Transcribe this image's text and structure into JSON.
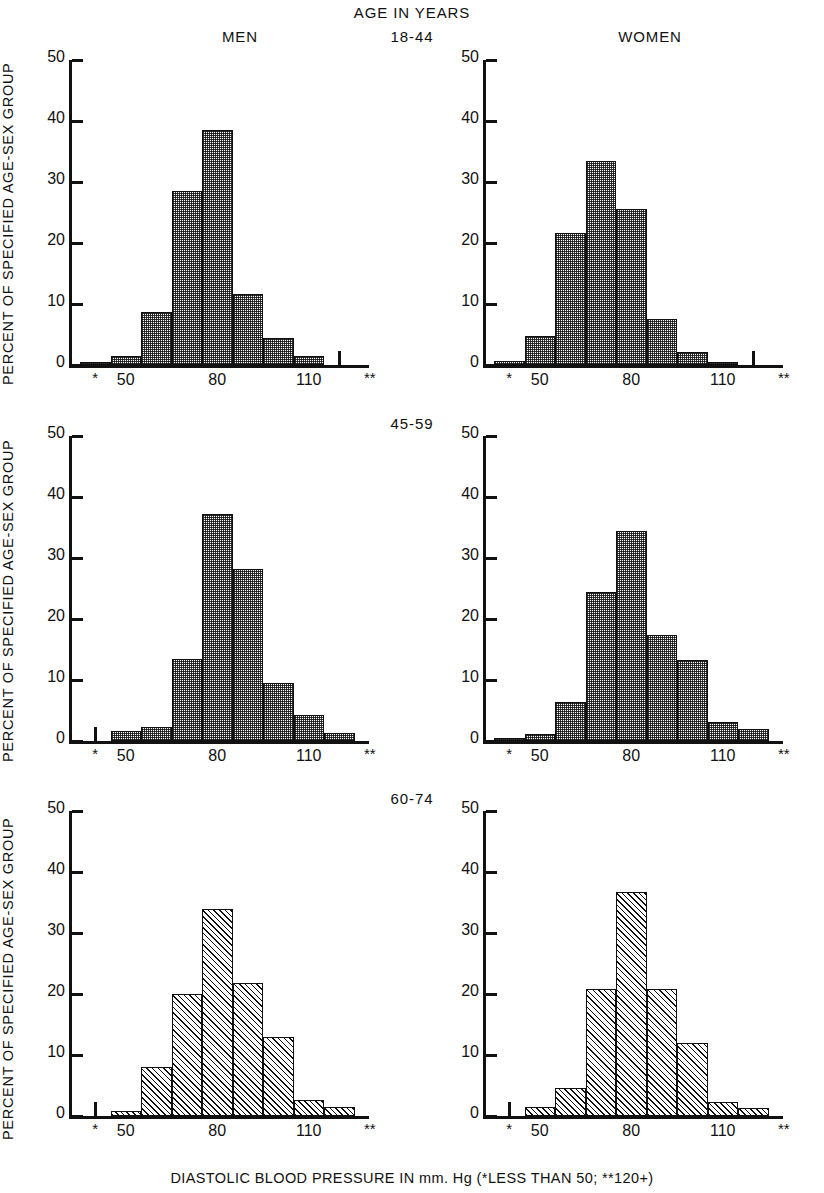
{
  "figure": {
    "super_title": "AGE IN YEARS",
    "column_titles": {
      "left": "MEN",
      "right": "WOMEN"
    },
    "y_axis_title": "PERCENT OF SPECIFIED AGE-SEX GROUP",
    "x_axis_caption": "DIASTOLIC BLOOD PRESSURE IN mm. Hg (*LESS THAN 50; **120+)",
    "row_labels": [
      "18-44",
      "45-59",
      "60-74"
    ],
    "y_ticks": [
      "0",
      "10",
      "20",
      "30",
      "40",
      "50"
    ],
    "x_ticks": [
      "*",
      "50",
      "80",
      "110",
      "**"
    ]
  },
  "chart_data": [
    {
      "type": "bar",
      "title": "MEN 18-44",
      "panel_id": "men-18-44",
      "sex": "MEN",
      "age_group": "18-44",
      "xlabel": "DIASTOLIC BLOOD PRESSURE IN mm. Hg",
      "ylabel": "PERCENT OF SPECIFIED AGE-SEX GROUP",
      "ylim": [
        0,
        50
      ],
      "yticks": [
        0,
        10,
        20,
        30,
        40,
        50
      ],
      "grid": false,
      "legend": "none",
      "categories": [
        "<50",
        "50-59",
        "60-69",
        "70-79",
        "80-89",
        "90-99",
        "100-109",
        "110-119",
        "120+"
      ],
      "values": [
        0.5,
        1.5,
        8.7,
        28.5,
        38.5,
        11.7,
        4.5,
        1.5,
        0.3
      ]
    },
    {
      "type": "bar",
      "title": "WOMEN 18-44",
      "panel_id": "women-18-44",
      "sex": "WOMEN",
      "age_group": "18-44",
      "xlabel": "DIASTOLIC BLOOD PRESSURE IN mm. Hg",
      "ylabel": "PERCENT OF SPECIFIED AGE-SEX GROUP",
      "ylim": [
        0,
        50
      ],
      "yticks": [
        0,
        10,
        20,
        30,
        40,
        50
      ],
      "grid": false,
      "legend": "none",
      "categories": [
        "<50",
        "50-59",
        "60-69",
        "70-79",
        "80-89",
        "90-99",
        "100-109",
        "110-119",
        "120+"
      ],
      "values": [
        0.6,
        4.7,
        21.7,
        33.4,
        25.5,
        7.5,
        2.1,
        0.4,
        0.2
      ]
    },
    {
      "type": "bar",
      "title": "MEN 45-59",
      "panel_id": "men-45-59",
      "sex": "MEN",
      "age_group": "45-59",
      "xlabel": "DIASTOLIC BLOOD PRESSURE IN mm. Hg",
      "ylabel": "PERCENT OF SPECIFIED AGE-SEX GROUP",
      "ylim": [
        0,
        50
      ],
      "yticks": [
        0,
        10,
        20,
        30,
        40,
        50
      ],
      "grid": false,
      "legend": "none",
      "categories": [
        "<50",
        "50-59",
        "60-69",
        "70-79",
        "80-89",
        "90-99",
        "100-109",
        "110-119",
        "120+"
      ],
      "values": [
        0.3,
        1.6,
        2.3,
        13.4,
        37.2,
        28.2,
        9.5,
        4.3,
        1.3
      ]
    },
    {
      "type": "bar",
      "title": "WOMEN 45-59",
      "panel_id": "women-45-59",
      "sex": "WOMEN",
      "age_group": "45-59",
      "xlabel": "DIASTOLIC BLOOD PRESSURE IN mm. Hg",
      "ylabel": "PERCENT OF SPECIFIED AGE-SEX GROUP",
      "ylim": [
        0,
        50
      ],
      "yticks": [
        0,
        10,
        20,
        30,
        40,
        50
      ],
      "grid": false,
      "legend": "none",
      "categories": [
        "<50",
        "50-59",
        "60-69",
        "70-79",
        "80-89",
        "90-99",
        "100-109",
        "110-119",
        "120+"
      ],
      "values": [
        0.4,
        1.2,
        6.4,
        24.4,
        34.4,
        17.3,
        13.3,
        3.1,
        2.0
      ]
    },
    {
      "type": "bar",
      "title": "MEN 60-74",
      "panel_id": "men-60-74",
      "sex": "MEN",
      "age_group": "60-74",
      "xlabel": "DIASTOLIC BLOOD PRESSURE IN mm. Hg",
      "ylabel": "PERCENT OF SPECIFIED AGE-SEX GROUP",
      "ylim": [
        0,
        50
      ],
      "yticks": [
        0,
        10,
        20,
        30,
        40,
        50
      ],
      "grid": false,
      "legend": "none",
      "categories": [
        "<50",
        "50-59",
        "60-69",
        "70-79",
        "80-89",
        "90-99",
        "100-109",
        "110-119",
        "120+"
      ],
      "values": [
        0.3,
        0.9,
        8.0,
        20.0,
        33.9,
        21.8,
        12.9,
        2.6,
        1.4
      ]
    },
    {
      "type": "bar",
      "title": "WOMEN 60-74",
      "panel_id": "women-60-74",
      "sex": "WOMEN",
      "age_group": "60-74",
      "xlabel": "DIASTOLIC BLOOD PRESSURE IN mm. Hg",
      "ylabel": "PERCENT OF SPECIFIED AGE-SEX GROUP",
      "ylim": [
        0,
        50
      ],
      "yticks": [
        0,
        10,
        20,
        30,
        40,
        50
      ],
      "grid": false,
      "legend": "none",
      "categories": [
        "<50",
        "50-59",
        "60-69",
        "70-79",
        "80-89",
        "90-99",
        "100-109",
        "110-119",
        "120+"
      ],
      "values": [
        0.3,
        1.5,
        4.6,
        20.8,
        36.8,
        20.8,
        11.9,
        2.3,
        1.3
      ]
    }
  ],
  "style": {
    "ink": "#111111",
    "paper": "#ffffff"
  }
}
